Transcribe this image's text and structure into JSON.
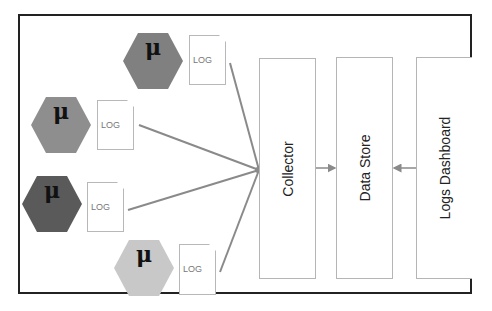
{
  "diagram": {
    "title": "",
    "colors": {
      "frame": "#222222",
      "connector": "#8a8a8a",
      "box_border": "#b5b5b5"
    },
    "microservices": [
      {
        "symbol": "μ",
        "log_label": "LOG",
        "color": "#808080"
      },
      {
        "symbol": "μ",
        "log_label": "LOG",
        "color": "#8e8e8e"
      },
      {
        "symbol": "μ",
        "log_label": "LOG",
        "color": "#5a5a5a"
      },
      {
        "symbol": "μ",
        "log_label": "LOG",
        "color": "#c8c8c8"
      }
    ],
    "components": [
      {
        "label": "Collector"
      },
      {
        "label": "Data Store"
      },
      {
        "label": "Logs Dashboard"
      }
    ],
    "edges": [
      {
        "from": "microservice-1 log",
        "to": "Collector"
      },
      {
        "from": "microservice-2 log",
        "to": "Collector"
      },
      {
        "from": "microservice-3 log",
        "to": "Collector"
      },
      {
        "from": "microservice-4 log",
        "to": "Collector"
      },
      {
        "from": "Collector",
        "to": "Data Store"
      },
      {
        "from": "Logs Dashboard",
        "to": "Data Store"
      }
    ]
  }
}
